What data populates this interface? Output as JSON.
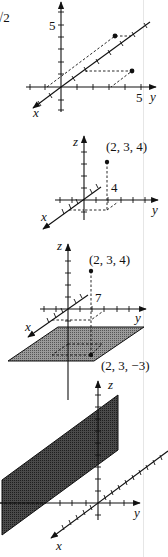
{
  "fragment_text": "√2",
  "figures": [
    {
      "id": "fig1",
      "axes": {
        "x_label": "x",
        "y_label": "y",
        "z_label": "z"
      },
      "tick_labels": {
        "vertical_5": "5",
        "y_5": "5"
      },
      "points": [
        {
          "label": ""
        },
        {
          "label": ""
        }
      ]
    },
    {
      "id": "fig2",
      "axes": {
        "x_label": "x",
        "y_label": "y",
        "z_label": "z"
      },
      "point_label": "(2, 3, 4)",
      "height_label": "4"
    },
    {
      "id": "fig3",
      "axes": {
        "x_label": "x",
        "y_label": "y",
        "z_label": "z"
      },
      "point_label": "(2, 3, 4)",
      "distance_label": "7",
      "projected_point_label": "(2, 3, −3)"
    },
    {
      "id": "fig4",
      "axes": {
        "x_label": "x",
        "y_label": "y",
        "z_label": "z"
      }
    }
  ],
  "colors": {
    "ink": "#111111",
    "plane_fill": "#8a8a8a",
    "plane_fill_dark": "#3a3a3a"
  }
}
